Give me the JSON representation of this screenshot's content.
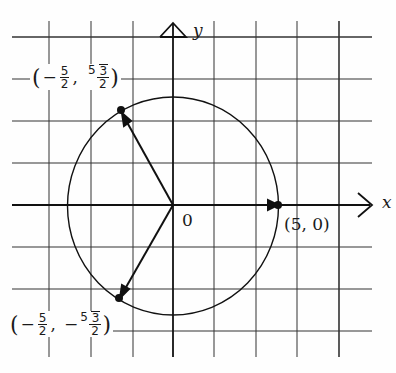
{
  "figure": {
    "axes": {
      "x_label": "x",
      "y_label": "y",
      "origin_label": "0"
    },
    "grid": {
      "x_lines_px": [
        49,
        91,
        133,
        173,
        214,
        256,
        297,
        339
      ],
      "y_lines_px": [
        37,
        79,
        121,
        163,
        205,
        247,
        289,
        331
      ],
      "unit_per_cell": 2
    },
    "circle": {
      "center": [
        0,
        0
      ],
      "radius": 5
    },
    "points": [
      {
        "name": "point-right",
        "coords": [
          5,
          0
        ],
        "label": "(5, 0)"
      },
      {
        "name": "point-upper-left",
        "coords": [
          "-5/2",
          "5√3/2"
        ],
        "label": "(−5/2, 5√3/2)",
        "x_sign": "−",
        "x_num": "5",
        "x_den": "2",
        "y_sign": "",
        "y_coef": "5",
        "y_rad": "3",
        "y_den": "2"
      },
      {
        "name": "point-lower-left",
        "coords": [
          "-5/2",
          "-5√3/2"
        ],
        "label": "(−5/2, −5√3/2)",
        "x_sign": "−",
        "x_num": "5",
        "x_den": "2",
        "y_sign": "−",
        "y_coef": "5",
        "y_rad": "3",
        "y_den": "2"
      }
    ],
    "vectors": [
      {
        "from": [
          0,
          0
        ],
        "to": [
          5,
          0
        ]
      },
      {
        "from": [
          0,
          0
        ],
        "to": [
          "-5/2",
          "5√3/2"
        ]
      },
      {
        "from": [
          0,
          0
        ],
        "to": [
          "-5/2",
          "-5√3/2"
        ]
      }
    ],
    "colors": {
      "ink": "#1a1a1a",
      "paper": "#fefefe"
    }
  }
}
